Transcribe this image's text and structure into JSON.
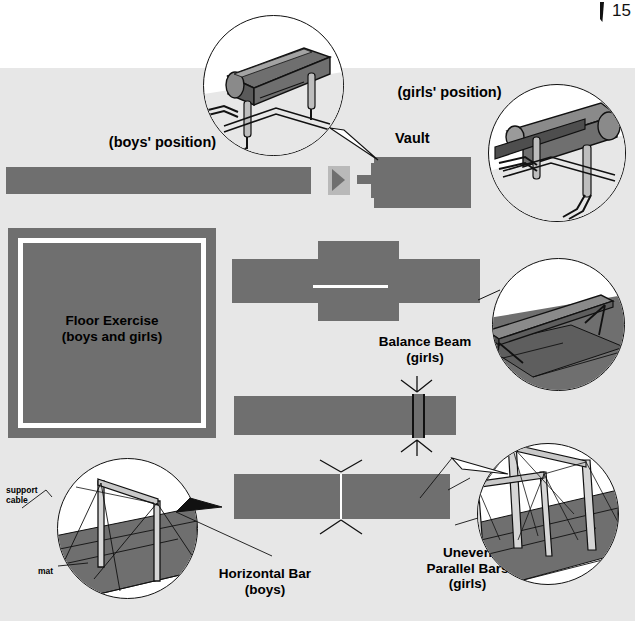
{
  "page": {
    "number": "15"
  },
  "figure": {
    "title_hidden": "",
    "background_color": "#e7e7e7",
    "equipment_color": "#6f6f6f",
    "line_color": "#111111"
  },
  "labels": {
    "boys_position": "(boys' position)",
    "girls_position": "(girls' position)",
    "vault": "Vault",
    "floor_exercise_line1": "Floor Exercise",
    "floor_exercise_line2": "(boys and girls)",
    "balance_beam_line1": "Balance Beam",
    "balance_beam_line2": "(girls)",
    "horizontal_bar_line1": "Horizontal Bar",
    "horizontal_bar_line2": "(boys)",
    "uneven_line1": "Uneven",
    "uneven_line2": "Parallel Bars",
    "uneven_line3": "(girls)",
    "support_cable_line1": "support",
    "support_cable_line2": "cable",
    "mat": "mat"
  },
  "apparatus": [
    {
      "name": "vault-runway",
      "kind": "runway-strip"
    },
    {
      "name": "vault-springboard",
      "kind": "springboard"
    },
    {
      "name": "vault-table",
      "kind": "vault-table-side"
    },
    {
      "name": "vault-landing-mat",
      "kind": "landing-mat"
    },
    {
      "name": "floor-exercise-mat",
      "kind": "square-mat-with-border"
    },
    {
      "name": "balance-beam-mat",
      "kind": "cross-mat-with-beam"
    },
    {
      "name": "horizontal-bar-mat",
      "kind": "rect-mat-with-bar"
    },
    {
      "name": "uneven-bars-mat",
      "kind": "rect-mat-with-bars"
    }
  ],
  "insets": [
    {
      "name": "vault-boys-inset",
      "caption_ref": "boys_position"
    },
    {
      "name": "vault-girls-inset",
      "caption_ref": "girls_position"
    },
    {
      "name": "balance-beam-inset",
      "caption_ref": "balance_beam_line1"
    },
    {
      "name": "horizontal-bar-inset",
      "caption_ref": "horizontal_bar_line1"
    },
    {
      "name": "uneven-bars-inset",
      "caption_ref": "uneven_line2"
    }
  ]
}
